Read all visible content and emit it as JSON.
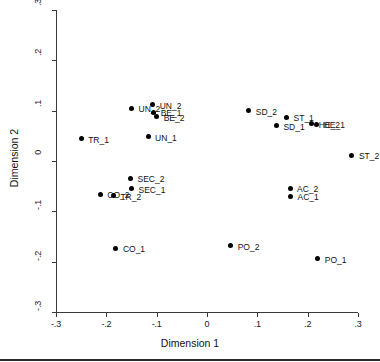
{
  "chart_data": {
    "type": "scatter",
    "title": "",
    "xlabel": "Dimension 1",
    "ylabel": "Dimension 2",
    "xlim": [
      -0.3,
      0.3
    ],
    "ylim": [
      -0.3,
      0.3
    ],
    "xticks": [
      -0.3,
      -0.2,
      -0.1,
      0,
      0.1,
      0.2,
      0.3
    ],
    "xtick_labels": [
      "-.3",
      "-.2",
      "-.1",
      "0",
      ".1",
      ".2",
      ".3"
    ],
    "yticks": [
      -0.3,
      -0.2,
      -0.1,
      0,
      0.1,
      0.2,
      0.3
    ],
    "ytick_labels": [
      "-.3",
      "-.2",
      "-.1",
      "0",
      ".1",
      ".2",
      ".3"
    ],
    "grid": false,
    "legend": "none",
    "marker_color": "#000000",
    "points": [
      {
        "label": "UN_2",
        "x": -0.15,
        "y": 0.105,
        "lx": 7,
        "ly": -4
      },
      {
        "label": "UN_2",
        "x": -0.108,
        "y": 0.112,
        "lx": 7,
        "ly": -4
      },
      {
        "label": "BE_1",
        "x": -0.106,
        "y": 0.097,
        "lx": 7,
        "ly": -4
      },
      {
        "label": "BE_2",
        "x": -0.1,
        "y": 0.088,
        "lx": 7,
        "ly": -4
      },
      {
        "label": "UN_1",
        "x": -0.117,
        "y": 0.048,
        "lx": 7,
        "ly": -4
      },
      {
        "label": "TR_1",
        "x": -0.25,
        "y": 0.044,
        "lx": 7,
        "ly": -4
      },
      {
        "label": "SD_2",
        "x": 0.083,
        "y": 0.1,
        "lx": 7,
        "ly": -4
      },
      {
        "label": "ST_1",
        "x": 0.158,
        "y": 0.087,
        "lx": 7,
        "ly": -4
      },
      {
        "label": "SD_1",
        "x": 0.138,
        "y": 0.07,
        "lx": 7,
        "ly": -4
      },
      {
        "label": "HE_2",
        "x": 0.208,
        "y": 0.074,
        "lx": 7,
        "ly": -4
      },
      {
        "label": "HE_1",
        "x": 0.218,
        "y": 0.073,
        "lx": 7,
        "ly": -4
      },
      {
        "label": "ST_2",
        "x": 0.288,
        "y": 0.011,
        "lx": 7,
        "ly": -4
      },
      {
        "label": "SEC_2",
        "x": -0.152,
        "y": -0.034,
        "lx": 7,
        "ly": -4
      },
      {
        "label": "SEC_1",
        "x": -0.15,
        "y": -0.055,
        "lx": 7,
        "ly": -4
      },
      {
        "label": "CO_2",
        "x": -0.212,
        "y": -0.066,
        "lx": 7,
        "ly": -4
      },
      {
        "label": "TR_2",
        "x": -0.186,
        "y": -0.069,
        "lx": 7,
        "ly": -4
      },
      {
        "label": "AC_2",
        "x": 0.165,
        "y": -0.054,
        "lx": 7,
        "ly": -4
      },
      {
        "label": "AC_1",
        "x": 0.166,
        "y": -0.07,
        "lx": 7,
        "ly": -4
      },
      {
        "label": "CO_1",
        "x": -0.181,
        "y": -0.173,
        "lx": 7,
        "ly": -4
      },
      {
        "label": "PO_2",
        "x": 0.047,
        "y": -0.168,
        "lx": 7,
        "ly": -4
      },
      {
        "label": "PO_1",
        "x": 0.22,
        "y": -0.194,
        "lx": 7,
        "ly": -4
      }
    ]
  }
}
